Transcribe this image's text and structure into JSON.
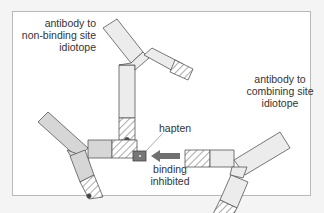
{
  "diagram": {
    "labels": {
      "antibody_non_binding": [
        "antibody to",
        "non-binding site",
        "idiotope"
      ],
      "antibody_combining": [
        "antibody to",
        "combining site",
        "idiotope"
      ],
      "hapten": "hapten",
      "binding_inhibited": [
        "binding",
        "inhibited"
      ]
    },
    "colors": {
      "antibody_fill_light": "#ececec",
      "antibody_fill_dark": "#d6d6d6",
      "outline": "#555555",
      "hapten_fill": "#777777",
      "arrow_fill": "#707070",
      "frame_border": "#b9b9b9"
    }
  }
}
